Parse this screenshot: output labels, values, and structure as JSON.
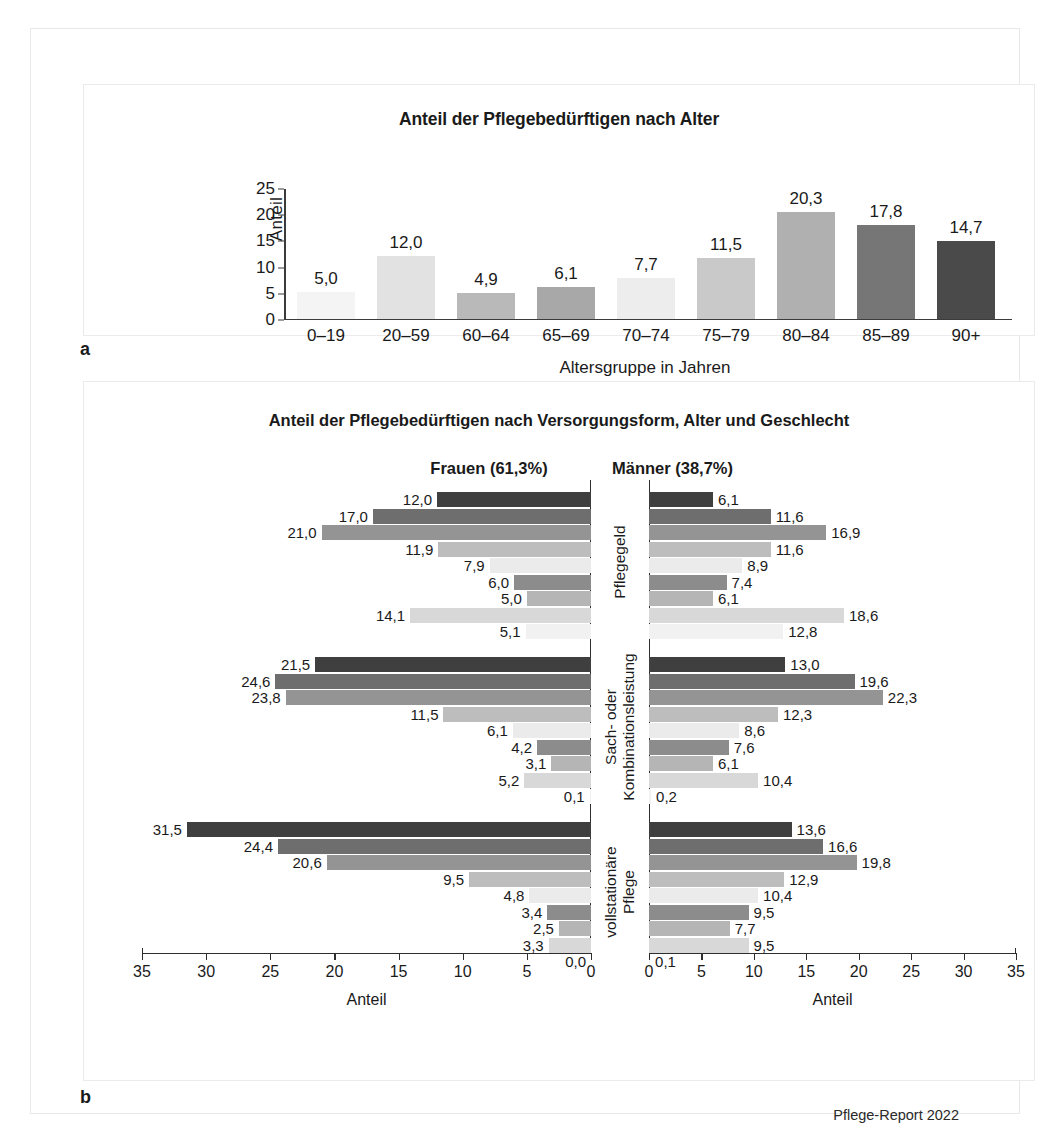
{
  "figure": {
    "panel_a_label": "a",
    "panel_b_label": "b",
    "footer": "Pflege-Report 2022"
  },
  "chart_data": [
    {
      "type": "bar",
      "panel": "a",
      "title": "Anteil der Pflegebedürftigen nach Alter",
      "xlabel": "Altersgruppe in Jahren",
      "ylabel": "Anteil",
      "ylim": [
        0,
        25
      ],
      "yticks": [
        "0",
        "5",
        "10",
        "15",
        "20",
        "25"
      ],
      "grid": false,
      "categories": [
        "0–19",
        "20–59",
        "60–64",
        "65–69",
        "70–74",
        "75–79",
        "80–84",
        "85–89",
        "90+"
      ],
      "values": [
        5.0,
        12.0,
        4.9,
        6.1,
        7.7,
        11.5,
        20.3,
        17.8,
        14.7
      ],
      "labels": [
        "5,0",
        "12,0",
        "4,9",
        "6,1",
        "7,7",
        "11,5",
        "20,3",
        "17,8",
        "14,7"
      ],
      "colors": [
        "#f4f4f4",
        "#e2e2e2",
        "#b9b9b9",
        "#a8a8a8",
        "#ededed",
        "#c9c9c9",
        "#b0b0b0",
        "#767676",
        "#4a4a4a"
      ]
    },
    {
      "type": "bar",
      "panel": "b",
      "orientation": "horizontal",
      "layout": "population-pyramid",
      "title": "Anteil der Pflegebedürftigen nach Versorgungsform, Alter und Geschlecht",
      "left_header": "Frauen (61,3%)",
      "right_header": "Männer (38,7%)",
      "xlabel_left": "Anteil",
      "xlabel_right": "Anteil",
      "xlim": [
        0,
        35
      ],
      "xticks_left": [
        "35",
        "30",
        "25",
        "20",
        "15",
        "10",
        "5",
        "0"
      ],
      "xticks_right": [
        "0",
        "5",
        "10",
        "15",
        "20",
        "25",
        "30",
        "35"
      ],
      "age_order_top_to_bottom": [
        "90+",
        "85–89",
        "80–84",
        "75–79",
        "70–74",
        "65–69",
        "60–64",
        "20–59",
        "0–19"
      ],
      "colors_top_to_bottom": [
        "#3f3f3f",
        "#6e6e6e",
        "#949494",
        "#bdbdbd",
        "#ebebeb",
        "#8c8c8c",
        "#b5b5b5",
        "#d8d8d8",
        "#f1f1f1"
      ],
      "groups": [
        {
          "name": "Pflegegeld",
          "label_lines": [
            "Pflegegeld"
          ],
          "frauen": [
            12.0,
            17.0,
            21.0,
            11.9,
            7.9,
            6.0,
            5.0,
            14.1,
            5.1
          ],
          "frauen_labels": [
            "12,0",
            "17,0",
            "21,0",
            "11,9",
            "7,9",
            "6,0",
            "5,0",
            "14,1",
            "5,1"
          ],
          "maenner": [
            6.1,
            11.6,
            16.9,
            11.6,
            8.9,
            7.4,
            6.1,
            18.6,
            12.8
          ],
          "maenner_labels": [
            "6,1",
            "11,6",
            "16,9",
            "11,6",
            "8,9",
            "7,4",
            "6,1",
            "18,6",
            "12,8"
          ]
        },
        {
          "name": "Sach- oder Kombinationsleistung",
          "label_lines": [
            "Sach- oder",
            "Kombinationsleistung"
          ],
          "frauen": [
            21.5,
            24.6,
            23.8,
            11.5,
            6.1,
            4.2,
            3.1,
            5.2,
            0.1
          ],
          "frauen_labels": [
            "21,5",
            "24,6",
            "23,8",
            "11,5",
            "6,1",
            "4,2",
            "3,1",
            "5,2",
            "0,1"
          ],
          "maenner": [
            13.0,
            19.6,
            22.3,
            12.3,
            8.6,
            7.6,
            6.1,
            10.4,
            0.2
          ],
          "maenner_labels": [
            "13,0",
            "19,6",
            "22,3",
            "12,3",
            "8,6",
            "7,6",
            "6,1",
            "10,4",
            "0,2"
          ]
        },
        {
          "name": "vollstationäre Pflege",
          "label_lines": [
            "vollstationäre",
            "Pflege"
          ],
          "frauen": [
            31.5,
            24.4,
            20.6,
            9.5,
            4.8,
            3.4,
            2.5,
            3.3,
            0.0
          ],
          "frauen_labels": [
            "31,5",
            "24,4",
            "20,6",
            "9,5",
            "4,8",
            "3,4",
            "2,5",
            "3,3",
            "0,0"
          ],
          "maenner": [
            13.6,
            16.6,
            19.8,
            12.9,
            10.4,
            9.5,
            7.7,
            9.5,
            0.1
          ],
          "maenner_labels": [
            "13,6",
            "16,6",
            "19,8",
            "12,9",
            "10,4",
            "9,5",
            "7,7",
            "9,5",
            "0,1"
          ]
        }
      ]
    }
  ]
}
